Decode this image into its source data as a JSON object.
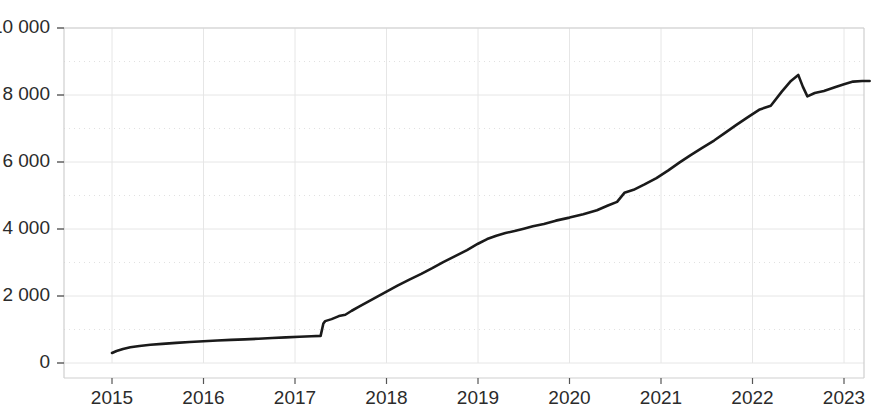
{
  "chart_data": {
    "type": "line",
    "title": "",
    "subtitle": "",
    "xlabel": "",
    "ylabel": "",
    "xlim": [
      2014.72,
      2023.5
    ],
    "ylim": [
      0,
      10000
    ],
    "grid": true,
    "legend": null,
    "annotations": [],
    "y_ticks": [
      0,
      2000,
      4000,
      6000,
      8000,
      10000
    ],
    "y_tick_labels": [
      "0",
      "2 000",
      "4 000",
      "6 000",
      "8 000",
      "10 000"
    ],
    "x_ticks": [
      2015,
      2016,
      2017,
      2018,
      2019,
      2020,
      2021,
      2022,
      2023
    ],
    "x_tick_labels": [
      "2015",
      "2016",
      "2017",
      "2018",
      "2019",
      "2020",
      "2021",
      "2022",
      "2023"
    ],
    "series": [
      {
        "name": "series-1",
        "color": "#1a1a1a",
        "x": [
          2015.0,
          2015.05,
          2015.12,
          2015.2,
          2015.3,
          2015.42,
          2015.55,
          2015.7,
          2015.85,
          2016.0,
          2016.15,
          2016.3,
          2016.45,
          2016.6,
          2016.75,
          2016.9,
          2017.05,
          2017.18,
          2017.28,
          2017.31,
          2017.33,
          2017.4,
          2017.48,
          2017.55,
          2017.62,
          2017.7,
          2017.8,
          2017.9,
          2018.0,
          2018.12,
          2018.25,
          2018.38,
          2018.5,
          2018.62,
          2018.75,
          2018.88,
          2019.0,
          2019.1,
          2019.2,
          2019.3,
          2019.4,
          2019.5,
          2019.6,
          2019.72,
          2019.85,
          2020.0,
          2020.15,
          2020.3,
          2020.42,
          2020.52,
          2020.6,
          2020.7,
          2020.82,
          2020.95,
          2021.08,
          2021.2,
          2021.32,
          2021.45,
          2021.58,
          2021.7,
          2021.82,
          2021.95,
          2022.08,
          2022.2,
          2022.32,
          2022.42,
          2022.5,
          2022.55,
          2022.6,
          2022.68,
          2022.78,
          2022.9,
          2023.0,
          2023.1,
          2023.2,
          2023.28
        ],
        "y": [
          300,
          360,
          420,
          470,
          510,
          545,
          570,
          600,
          625,
          650,
          670,
          690,
          705,
          725,
          745,
          765,
          785,
          800,
          810,
          1180,
          1250,
          1310,
          1400,
          1440,
          1560,
          1680,
          1830,
          1980,
          2130,
          2310,
          2490,
          2660,
          2830,
          3010,
          3190,
          3370,
          3560,
          3700,
          3800,
          3880,
          3940,
          4010,
          4080,
          4150,
          4250,
          4340,
          4440,
          4560,
          4700,
          4810,
          5080,
          5170,
          5330,
          5520,
          5750,
          5980,
          6200,
          6420,
          6640,
          6870,
          7100,
          7340,
          7570,
          7680,
          8100,
          8420,
          8600,
          8250,
          7960,
          8060,
          8120,
          8230,
          8320,
          8400,
          8420,
          8420
        ]
      }
    ]
  },
  "axes": {
    "plot_left": 64,
    "plot_right": 864,
    "plot_top": 28,
    "plot_bottom": 363,
    "frame_bottom": 378,
    "year_origin": 2015,
    "year_origin_px": 112,
    "px_per_year": 91.5
  },
  "colors": {
    "line": "#1a1a1a",
    "grid": "#e6e6e6",
    "gridline_dotted": "#d8d8d8",
    "frame": "#cfcfcf",
    "tick": "#555555",
    "text": "#2b2b2b",
    "background": "#ffffff"
  }
}
